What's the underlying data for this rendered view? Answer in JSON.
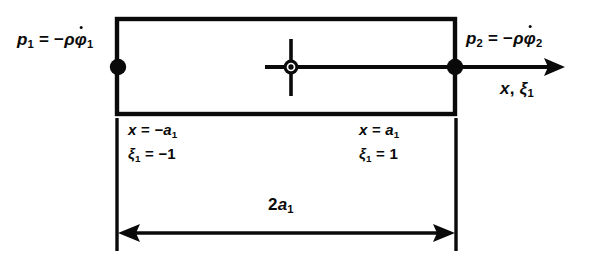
{
  "diagram": {
    "colors": {
      "stroke": "#0a0a0a",
      "background": "#ffffff"
    },
    "geometry": {
      "rect_left": 117,
      "rect_right": 455,
      "rect_top": 19,
      "rect_bottom": 114,
      "axis_y": 67,
      "center_x": 291,
      "arrow_tip_x": 565,
      "dim_line_y": 233,
      "extension_top_y": 118,
      "extension_bottom_y": 251,
      "stroke_width": 4
    },
    "labels": {
      "pressure_left": {
        "p": "p",
        "p_sub": "1",
        "equals": "=",
        "minus": "−",
        "rho": "ρ",
        "phi": "φ",
        "phi_sub": "1",
        "full": "p₁ = −ρφ̇₁"
      },
      "pressure_right": {
        "p": "p",
        "p_sub": "2",
        "equals": "=",
        "minus": "−",
        "rho": "ρ",
        "phi": "φ",
        "phi_sub": "2",
        "full": "p₂ = −ρφ̇₂"
      },
      "axis": {
        "x": "x",
        "comma": ",",
        "xi": "ξ",
        "xi_sub": "1",
        "full": "x, ξ₁"
      },
      "left_node_x": {
        "var": "x",
        "equals": "=",
        "value": "−a",
        "value_sub": "1",
        "full": "x = −a₁"
      },
      "left_node_xi": {
        "var": "ξ",
        "var_sub": "1",
        "equals": "=",
        "value": "−1",
        "full": "ξ₁ = −1"
      },
      "right_node_x": {
        "var": "x",
        "equals": "=",
        "value": "a",
        "value_sub": "1",
        "full": "x = a₁"
      },
      "right_node_xi": {
        "var": "ξ",
        "var_sub": "1",
        "equals": "=",
        "value": "1",
        "full": "ξ₁ = 1"
      },
      "dimension": {
        "coefficient": "2",
        "symbol": "a",
        "symbol_sub": "1",
        "full": "2a₁"
      }
    },
    "nodes": [
      {
        "name": "left-node",
        "x": 118,
        "y": 67,
        "radius": 8,
        "style": "filled-dot"
      },
      {
        "name": "center-node",
        "x": 291,
        "y": 67,
        "radius": 7,
        "style": "crosshair-ring"
      },
      {
        "name": "right-node",
        "x": 455,
        "y": 67,
        "radius": 8,
        "style": "filled-dot"
      }
    ]
  }
}
